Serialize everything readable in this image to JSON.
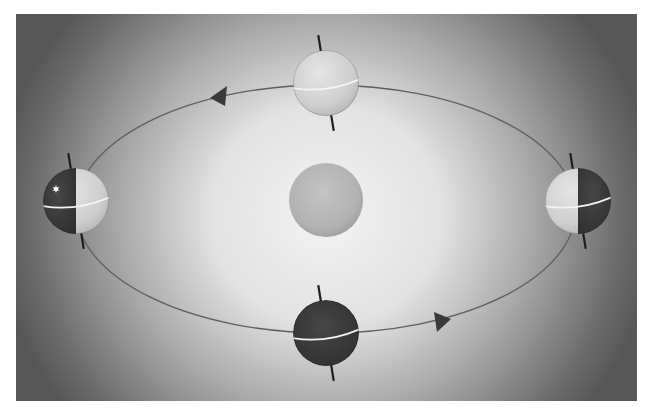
{
  "diagram": {
    "type": "orbit-diagram",
    "canvas": {
      "width": 654,
      "height": 418
    },
    "panel": {
      "x": 16,
      "y": 14,
      "width": 621,
      "height": 387
    },
    "colors": {
      "page_bg": "#ffffff",
      "panel_edge": "#5a5a5a",
      "panel_center": "#f2f2f2",
      "orbit": "#5e5e5e",
      "axis": "#1e1e1e",
      "equator": "#f4f4f4",
      "day_side": "#d2d2d2",
      "night_side": "#3e3e3e",
      "sun": "#b8b8b8",
      "arrow": "#3a3a3a",
      "marker": "#ffffff"
    },
    "orbit": {
      "cx": 326,
      "cy": 209,
      "rx": 250,
      "ry": 124
    },
    "sun": {
      "label": "sun",
      "cx": 326,
      "cy": 200,
      "r": 37
    },
    "earths": [
      {
        "id": "top",
        "position": "far",
        "cx": 326,
        "cy": 83,
        "r": 33,
        "lit": "full-day"
      },
      {
        "id": "left",
        "position": "left",
        "cx": 76,
        "cy": 201,
        "r": 33,
        "lit": "right-half-day",
        "marker": "star"
      },
      {
        "id": "right",
        "position": "right",
        "cx": 578,
        "cy": 201,
        "r": 33,
        "lit": "left-half-day"
      },
      {
        "id": "bottom",
        "position": "near",
        "cx": 326,
        "cy": 333,
        "r": 33,
        "lit": "full-night"
      }
    ],
    "direction_arrows": [
      {
        "id": "arrow-top-left",
        "x": 219,
        "y": 96,
        "pointing": "left"
      },
      {
        "id": "arrow-bottom-right",
        "x": 441,
        "y": 321,
        "pointing": "right"
      }
    ],
    "text_labels": []
  }
}
